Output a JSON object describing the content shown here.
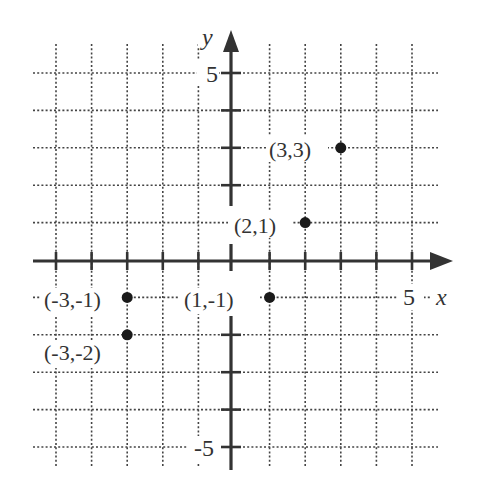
{
  "chart_data": {
    "type": "scatter",
    "title": "",
    "xlabel": "x",
    "ylabel": "y",
    "xlim": [
      -5,
      5
    ],
    "ylim": [
      -5,
      5
    ],
    "grid": true,
    "grid_style": "dotted",
    "tick_labels": {
      "x": [
        {
          "value": 5,
          "label": "5"
        }
      ],
      "y": [
        {
          "value": 5,
          "label": "5"
        },
        {
          "value": -5,
          "label": "-5"
        }
      ]
    },
    "points": [
      {
        "x": 3,
        "y": 3,
        "label": "(3,3)",
        "label_side": "left"
      },
      {
        "x": 2,
        "y": 1,
        "label": "(2,1)",
        "label_side": "left"
      },
      {
        "x": -3,
        "y": -1,
        "label": "(-3,-1)",
        "label_side": "left"
      },
      {
        "x": 1,
        "y": -1,
        "label": "(1,-1)",
        "label_side": "left"
      },
      {
        "x": -3,
        "y": -2,
        "label": "(-3,-2)",
        "label_side": "below-left"
      }
    ],
    "legend": null
  },
  "colors": {
    "ink": "#333333",
    "point": "#1a1a1a",
    "background": "#ffffff"
  }
}
